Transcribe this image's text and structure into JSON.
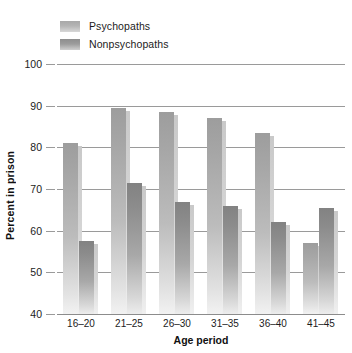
{
  "chart_data": {
    "type": "bar",
    "title": "",
    "xlabel": "Age period",
    "ylabel": "Percent in prison",
    "categories": [
      "16–20",
      "21–25",
      "26–30",
      "31–35",
      "36–40",
      "41–45"
    ],
    "ylim": [
      40,
      100
    ],
    "yticks": [
      40,
      50,
      60,
      70,
      80,
      90,
      100
    ],
    "ytick_labels": [
      "40",
      "50",
      "60",
      "70",
      "80",
      "90",
      "100"
    ],
    "grid": true,
    "legend_position": "top-left",
    "series": [
      {
        "name": "Psychopaths",
        "color": "#a6a6a6",
        "values": [
          81,
          89.5,
          88.5,
          87,
          83.5,
          57
        ]
      },
      {
        "name": "Nonpsychopaths",
        "color": "#8c8c8c",
        "values": [
          57.5,
          71.5,
          67,
          66,
          62,
          65.5
        ]
      }
    ]
  },
  "legend": {
    "items": [
      {
        "label": "Psychopaths",
        "swatch": "psy"
      },
      {
        "label": "Nonpsychopaths",
        "swatch": "nonpsy"
      }
    ]
  },
  "axes": {
    "y_title": "Percent in prison",
    "x_title": "Age period"
  }
}
